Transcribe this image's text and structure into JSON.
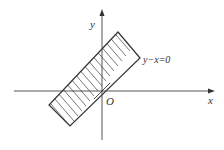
{
  "diagram": {
    "type": "coordinate-region",
    "axes": {
      "x_label": "x",
      "y_label": "y",
      "origin_label": "O"
    },
    "line_label": "y−x=0",
    "region": {
      "description": "Hatched rectangular band centered on the line y - x = 0",
      "shading": "parallel hatching"
    },
    "colors": {
      "stroke": "#444444",
      "background": "#ffffff"
    }
  }
}
